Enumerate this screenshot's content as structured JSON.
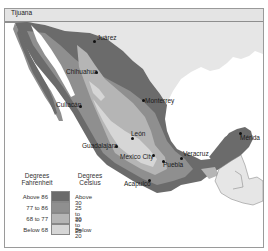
{
  "map": {
    "country": "Mexico",
    "cities": [
      {
        "name": "Tijuana",
        "x": 10,
        "y": 1
      },
      {
        "name": "Juárez",
        "x": 91,
        "y": 29
      },
      {
        "name": "Chihuahua",
        "x": 67,
        "y": 61
      },
      {
        "name": "Culiacán",
        "x": 53,
        "y": 95
      },
      {
        "name": "Monterrey",
        "x": 142,
        "y": 89
      },
      {
        "name": "León",
        "x": 127,
        "y": 131
      },
      {
        "name": "Guadalajara",
        "x": 93,
        "y": 139
      },
      {
        "name": "Mexico City",
        "x": 121,
        "y": 151
      },
      {
        "name": "Puebla",
        "x": 138,
        "y": 155
      },
      {
        "name": "Veracruz",
        "x": 177,
        "y": 147
      },
      {
        "name": "Mérida",
        "x": 236,
        "y": 131
      },
      {
        "name": "Acapulco",
        "x": 144,
        "y": 175
      }
    ]
  },
  "legend": {
    "fahrenheit_header": "Degrees Fahrenheit",
    "celsius_header": "Degrees Celsius",
    "items": [
      {
        "fahrenheit": "Above 86",
        "celsius": "Above 30",
        "color": "#6b6b6b"
      },
      {
        "fahrenheit": "77 to 86",
        "celsius": "25 to 30",
        "color": "#8f8f8f"
      },
      {
        "fahrenheit": "68 to 77",
        "celsius": "20 to 25",
        "color": "#b5b5b5"
      },
      {
        "fahrenheit": "Below 68",
        "celsius": "Below 20",
        "color": "#d6d6d6"
      }
    ]
  },
  "colors": {
    "hot": "#6b6b6b",
    "warm": "#8f8f8f",
    "mild": "#b5b5b5",
    "cool": "#d6d6d6",
    "neighbor_land": "#e6e6e6",
    "water": "#ffffff"
  }
}
